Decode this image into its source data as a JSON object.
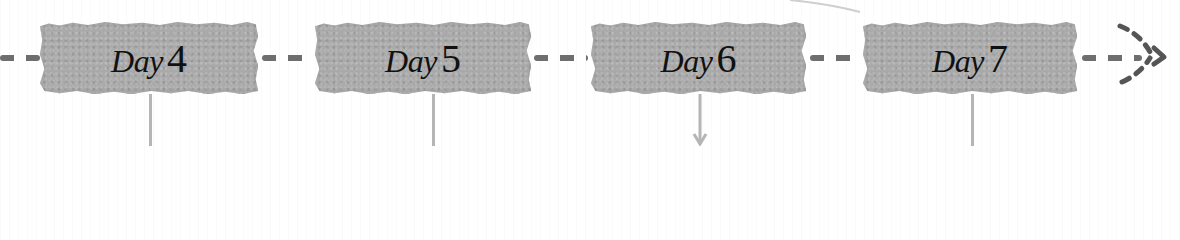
{
  "timeline": {
    "days": [
      {
        "word": "Day",
        "number": "4"
      },
      {
        "word": "Day",
        "number": "5"
      },
      {
        "word": "Day",
        "number": "6"
      },
      {
        "word": "Day",
        "number": "7"
      }
    ],
    "continuation": "dashed-arrow-right",
    "colors": {
      "box_fill": "#a9a9a9",
      "dash": "#6e6e6e",
      "stem": "#b5b5b5",
      "text": "#111111"
    }
  }
}
